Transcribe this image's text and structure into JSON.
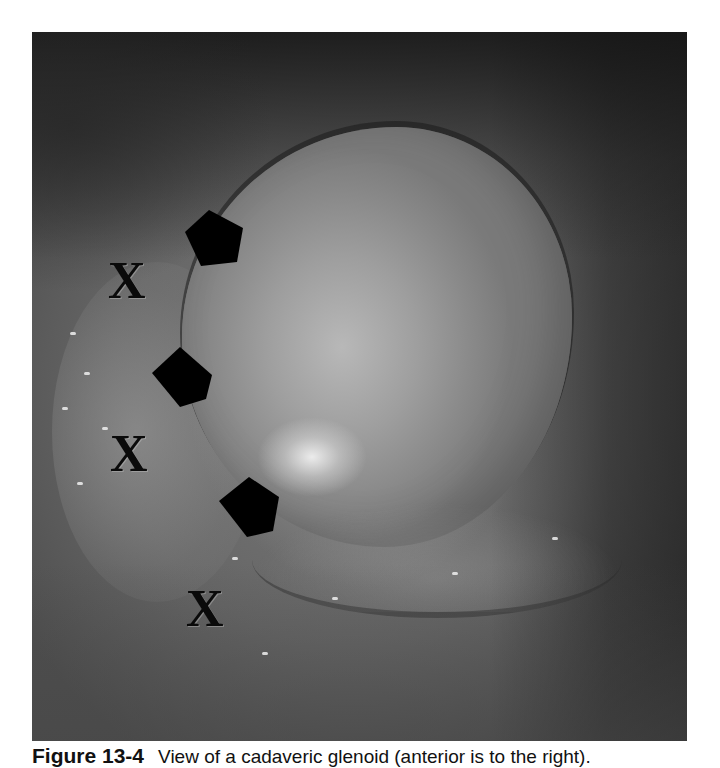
{
  "figure": {
    "photo": {
      "subject": "arthroscopic-view-cadaveric-glenoid",
      "colors": {
        "dark": "#2a2a2a",
        "mid": "#7a7a7a",
        "light": "#b8b8b8",
        "marker": "#000000"
      }
    },
    "markers": [
      {
        "shape": "pentagon",
        "x": 183,
        "y": 213
      },
      {
        "shape": "pentagon",
        "x": 150,
        "y": 345
      },
      {
        "shape": "pentagon",
        "x": 217,
        "y": 475
      }
    ],
    "x_labels": [
      {
        "text": "X",
        "x": 108,
        "y": 255
      },
      {
        "text": "X",
        "x": 110,
        "y": 428
      },
      {
        "text": "X",
        "x": 186,
        "y": 583
      }
    ],
    "caption": {
      "number": "Figure 13-4",
      "text": "View of a cadaveric glenoid (anterior is to the right)."
    }
  }
}
